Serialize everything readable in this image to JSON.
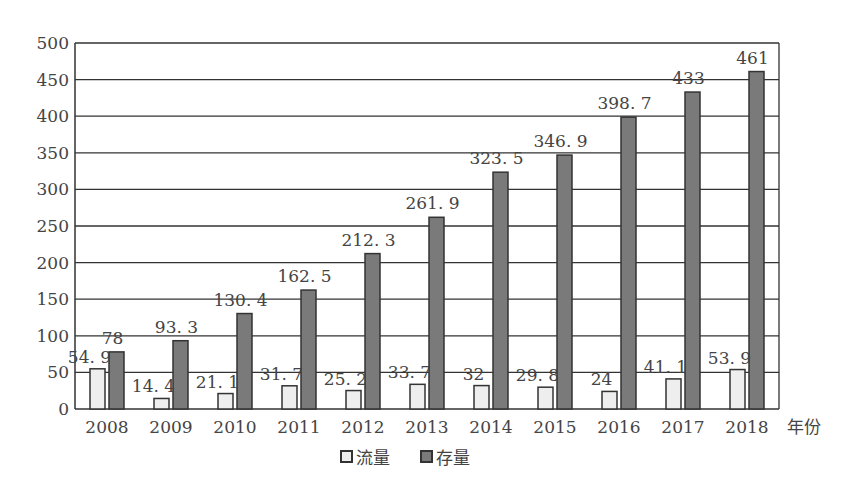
{
  "chart_data": {
    "type": "bar",
    "title": "",
    "xlabel": "年份",
    "ylabel": "",
    "ylim": [
      0,
      500
    ],
    "yticks": [
      0,
      50,
      100,
      150,
      200,
      250,
      300,
      350,
      400,
      450,
      500
    ],
    "grid": true,
    "legend_position": "bottom",
    "categories": [
      "2008",
      "2009",
      "2010",
      "2011",
      "2012",
      "2013",
      "2014",
      "2015",
      "2016",
      "2017",
      "2018"
    ],
    "series": [
      {
        "name": "流量",
        "color": "#eeeeee",
        "values": [
          54.9,
          14.4,
          21.1,
          31.7,
          25.2,
          33.7,
          32,
          29.8,
          24,
          41.1,
          53.9
        ],
        "labels": [
          "54.9",
          "14.4",
          "21.1",
          "31.7",
          "25.2",
          "33.7",
          "32",
          "29.8",
          "24",
          "41.1",
          "53.9"
        ]
      },
      {
        "name": "存量",
        "color": "#7a7a7a",
        "values": [
          78,
          93.3,
          130.4,
          162.5,
          212.3,
          261.9,
          323.5,
          346.9,
          398.7,
          433,
          461
        ],
        "labels": [
          "78",
          "93.3",
          "130.4",
          "162.5",
          "212.3",
          "261.9",
          "323.5",
          "346.9",
          "398.7",
          "433",
          "461"
        ]
      }
    ]
  },
  "legend": {
    "flow_label": "流量",
    "stock_label": "存量"
  },
  "axis": {
    "x_unit_label": "年份"
  }
}
